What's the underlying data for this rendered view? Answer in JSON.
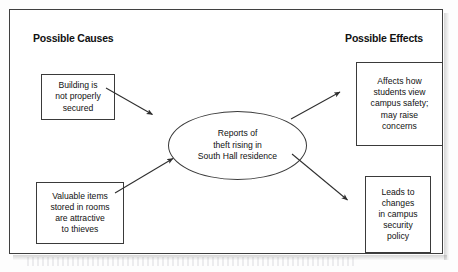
{
  "figure": {
    "type": "cause-and-effect-diagram",
    "headers": {
      "causes": "Possible Causes",
      "effects": "Possible Effects"
    },
    "central_node": {
      "shape": "ellipse",
      "text": "Reports of\ntheft rising in\nSouth Hall residence",
      "lines": [
        "Reports of",
        "theft rising in",
        "South Hall residence"
      ]
    },
    "causes": [
      {
        "id": "cause-1",
        "text": "Building is\nnot properly\nsecured",
        "lines": [
          "Building is",
          "not properly",
          "secured"
        ]
      },
      {
        "id": "cause-2",
        "text": "Valuable items\nstored in rooms\nare attractive\nto thieves",
        "lines": [
          "Valuable items",
          "stored in rooms",
          "are attractive",
          "to thieves"
        ]
      }
    ],
    "effects": [
      {
        "id": "effect-1",
        "text": "Affects how\nstudents view\ncampus safety;\nmay raise\nconcerns",
        "lines": [
          "Affects how",
          "students view",
          "campus safety;",
          "may raise",
          "concerns"
        ]
      },
      {
        "id": "effect-2",
        "text": "Leads to\nchanges\nin campus\nsecurity\npolicy",
        "lines": [
          "Leads to",
          "changes",
          "in campus",
          "security",
          "policy"
        ]
      }
    ],
    "arrows": [
      {
        "id": "arrow-cause1-to-center",
        "from": "cause-1",
        "to": "central-node",
        "direction": "down-right"
      },
      {
        "id": "arrow-cause2-to-center",
        "from": "cause-2",
        "to": "central-node",
        "direction": "up-right"
      },
      {
        "id": "arrow-center-to-effect1",
        "from": "central-node",
        "to": "effect-1",
        "direction": "up-right"
      },
      {
        "id": "arrow-center-to-effect2",
        "from": "central-node",
        "to": "effect-2",
        "direction": "down-right"
      }
    ],
    "colors": {
      "stroke": "#3a3a3a",
      "frame": "#3f3f3f",
      "text": "#111111",
      "background": "#ffffff"
    }
  }
}
